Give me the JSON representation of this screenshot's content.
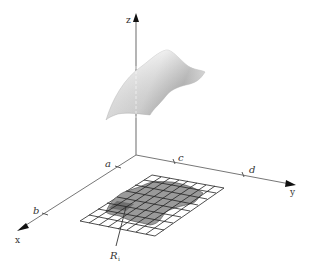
{
  "figure": {
    "type": "3d-surface-over-region",
    "axes": {
      "x_label": "x",
      "y_label": "y",
      "z_label": "z"
    },
    "x_ticks": [
      "a",
      "b"
    ],
    "y_ticks": [
      "c",
      "d"
    ],
    "region_label": "R",
    "region_label_subscript": "i",
    "colors": {
      "axis": "#555555",
      "grid_line": "#333333",
      "region_fill": "#9a9a9a",
      "region_dark": "#7a7a7a",
      "surface_light": "#f2f2f2",
      "surface_dark": "#8c8c8c"
    }
  }
}
